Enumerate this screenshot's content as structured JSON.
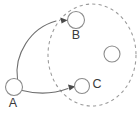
{
  "diagram": {
    "type": "directed-graph-with-region",
    "background_color": "#ffffff",
    "stroke_color": "#8c8c8c",
    "edge_color": "#6f6f6f",
    "label_color": "#3a3a3a",
    "region": {
      "name": "dashed-region",
      "shape": "ellipse",
      "style": "dashed",
      "cx": 92,
      "cy": 55,
      "rx": 44,
      "ry": 51,
      "label": ""
    },
    "nodes": [
      {
        "id": "A",
        "label": "A",
        "cx": 14,
        "cy": 87,
        "r": 8.5,
        "label_x": 13,
        "label_y": 104,
        "inside_region": false
      },
      {
        "id": "B",
        "label": "B",
        "cx": 76,
        "cy": 20,
        "r": 8.5,
        "label_x": 76,
        "label_y": 36,
        "inside_region": true
      },
      {
        "id": "C",
        "label": "C",
        "cx": 82,
        "cy": 86,
        "r": 7.5,
        "label_x": 97,
        "label_y": 85,
        "inside_region": true
      },
      {
        "id": "D",
        "label": "",
        "cx": 112,
        "cy": 54,
        "r": 8.0,
        "label_x": 112,
        "label_y": 54,
        "inside_region": true
      }
    ],
    "edges": [
      {
        "id": "A-B",
        "from": "A",
        "to": "B",
        "style": "curved",
        "directed": true,
        "label": ""
      },
      {
        "id": "A-C",
        "from": "A",
        "to": "C",
        "style": "slight-curve",
        "directed": true,
        "label": ""
      }
    ]
  }
}
